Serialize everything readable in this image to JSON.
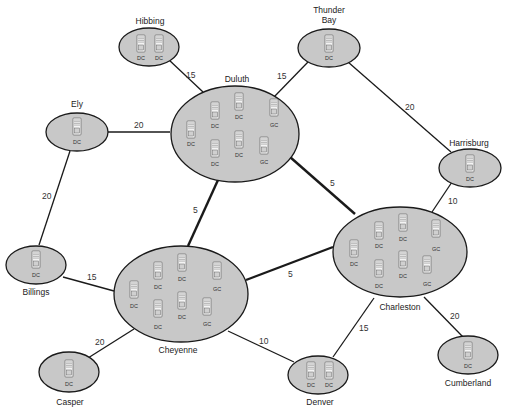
{
  "diagram": {
    "type": "network-topology",
    "colors": {
      "site_fill": "#c8c8c8",
      "site_stroke": "#1a1a1a",
      "link": "#1a1a1a",
      "text": "#222222"
    },
    "sites": [
      {
        "id": "hibbing",
        "name": "Hibbing",
        "servers": [
          "DC",
          "DC"
        ]
      },
      {
        "id": "thunder_bay",
        "name_line1": "Thunder",
        "name_line2": "Bay",
        "servers": [
          "DC"
        ]
      },
      {
        "id": "duluth",
        "name": "Duluth",
        "servers": [
          "DC",
          "DC",
          "DC",
          "GC",
          "DC",
          "DC",
          "GC"
        ]
      },
      {
        "id": "ely",
        "name": "Ely",
        "servers": [
          "DC"
        ]
      },
      {
        "id": "harrisburg",
        "name": "Harrisburg",
        "servers": [
          "DC"
        ]
      },
      {
        "id": "charleston",
        "name": "Charleston",
        "servers": [
          "DC",
          "DC",
          "DC",
          "GC",
          "DC",
          "DC",
          "GC"
        ]
      },
      {
        "id": "cheyenne",
        "name": "Cheyenne",
        "servers": [
          "DC",
          "DC",
          "DC",
          "GC",
          "DC",
          "DC",
          "GC"
        ]
      },
      {
        "id": "billings",
        "name": "Billings",
        "servers": [
          "DC"
        ]
      },
      {
        "id": "casper",
        "name": "Casper",
        "servers": [
          "DC"
        ]
      },
      {
        "id": "denver",
        "name": "Denver",
        "servers": [
          "DC",
          "DC"
        ]
      },
      {
        "id": "cumberland",
        "name": "Cumberland",
        "servers": [
          "DC"
        ]
      }
    ],
    "links": [
      {
        "from": "Hibbing",
        "to": "Duluth",
        "cost": "15"
      },
      {
        "from": "Thunder Bay",
        "to": "Duluth",
        "cost": "15"
      },
      {
        "from": "Thunder Bay",
        "to": "Harrisburg",
        "cost": "20"
      },
      {
        "from": "Ely",
        "to": "Duluth",
        "cost": "20"
      },
      {
        "from": "Ely",
        "to": "Billings",
        "cost": "20"
      },
      {
        "from": "Duluth",
        "to": "Cheyenne",
        "cost": "5"
      },
      {
        "from": "Duluth",
        "to": "Charleston",
        "cost": "5"
      },
      {
        "from": "Harrisburg",
        "to": "Charleston",
        "cost": "10"
      },
      {
        "from": "Cheyenne",
        "to": "Charleston",
        "cost": "5"
      },
      {
        "from": "Billings",
        "to": "Cheyenne",
        "cost": "15"
      },
      {
        "from": "Cheyenne",
        "to": "Casper",
        "cost": "20"
      },
      {
        "from": "Cheyenne",
        "to": "Denver",
        "cost": "10"
      },
      {
        "from": "Charleston",
        "to": "Denver",
        "cost": "15"
      },
      {
        "from": "Charleston",
        "to": "Cumberland",
        "cost": "20"
      }
    ]
  }
}
